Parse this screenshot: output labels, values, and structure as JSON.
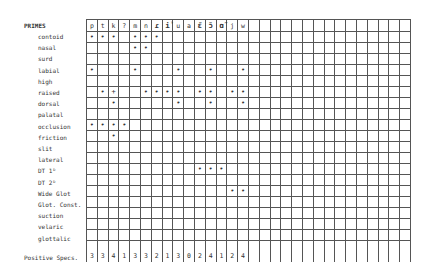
{
  "table": {
    "title": "PRIMES",
    "total_label": "Positive Specs.",
    "columns": [
      "p",
      "t",
      "k",
      "?",
      "m",
      "n",
      "ɾ",
      "ỉ",
      "u",
      "a",
      "ɛ̃",
      "ɔ̃",
      "ɑ̃",
      "j",
      "w",
      "",
      "",
      "",
      "",
      "",
      "",
      "",
      "",
      "",
      "",
      "",
      "",
      "",
      "",
      ""
    ],
    "bold_columns": [
      6,
      7,
      10,
      11,
      12
    ],
    "rows": [
      {
        "label": "contoid",
        "marks": "+ + + · + + + · · · · · · · ·"
      },
      {
        "label": "nasal",
        "marks": "· · · · + + · · · · · · · · ·"
      },
      {
        "label": "surd",
        "marks": "· · · · · · · · · · · · · · ·"
      },
      {
        "label": "labial",
        "marks": "+ · · · + · · · + · · + · · +"
      },
      {
        "label": "high",
        "marks": "· · · · · · · · · · · · · · ·"
      },
      {
        "label": "raised",
        "marks": "· + ┼ · · + + + + · + + · + +"
      },
      {
        "label": "dorsal",
        "marks": "· · + · · · · · + · · + · · +"
      },
      {
        "label": "palatal",
        "marks": "· · · · · · · · · · · · · · ·"
      },
      {
        "label": "occlusion",
        "marks": "+ + + + · · · · · · · · · · ·"
      },
      {
        "label": "friction",
        "marks": "· · + · · · · · · · · · · · ·"
      },
      {
        "label": "slit",
        "marks": "· · · · · · · · · · · · · · ·"
      },
      {
        "label": "lateral",
        "marks": "· · · · · · · · · · · · · · ·"
      },
      {
        "label": "DT 1ᴰ",
        "marks": "· · · · · · · · · · + + + · ·"
      },
      {
        "label": "DT 2ᴰ",
        "marks": "· · · · · · · · · · · · · · ·"
      },
      {
        "label": "Wide Glot",
        "marks": "· · · · · · · · · · · · · + +"
      },
      {
        "label": "Glot. Const.",
        "marks": "· · · · · · · · · · · · · · ·"
      },
      {
        "label": "suction",
        "marks": "· · · · · · · · · · · · · · ·"
      },
      {
        "label": "velaric",
        "marks": "· · · · · · · · · · · · · · ·"
      },
      {
        "label": "glottalic",
        "marks": "· · · · · · · · · · · · · · ·"
      }
    ],
    "positive_specs": [
      "3",
      "3",
      "4",
      "1",
      "3",
      "3",
      "2",
      "1",
      "3",
      "0",
      "2",
      "4",
      "1",
      "2",
      "4"
    ]
  }
}
